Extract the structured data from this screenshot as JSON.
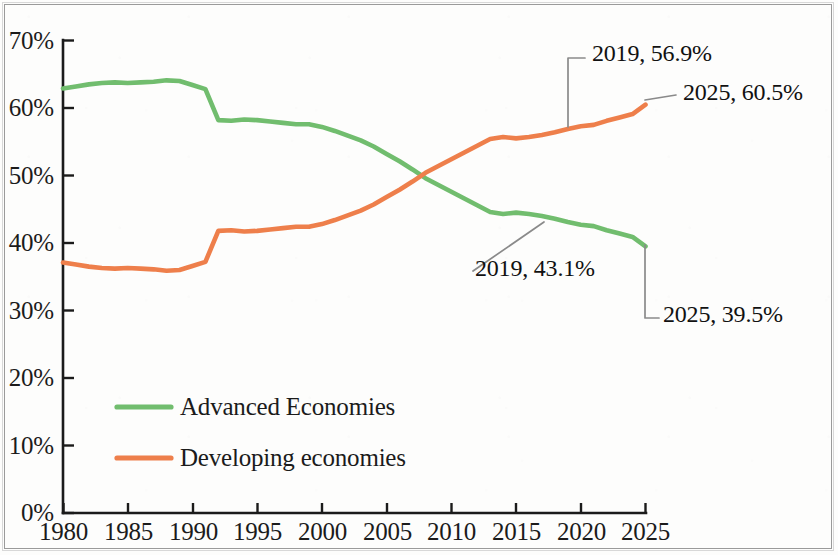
{
  "chart_data": {
    "type": "line",
    "title": "",
    "subtitle": "",
    "xlabel": "",
    "ylabel": "",
    "xlim": [
      1980,
      2025
    ],
    "ylim": [
      0,
      70
    ],
    "grid": false,
    "legend_position": "inside-lower-left",
    "x_ticks": [
      "1980",
      "1985",
      "1990",
      "1995",
      "2000",
      "2005",
      "2010",
      "2015",
      "2020",
      "2025"
    ],
    "y_ticks": [
      "0%",
      "10%",
      "20%",
      "30%",
      "40%",
      "50%",
      "60%",
      "70%"
    ],
    "x": [
      1980,
      1981,
      1982,
      1983,
      1984,
      1985,
      1986,
      1987,
      1988,
      1989,
      1990,
      1991,
      1992,
      1993,
      1994,
      1995,
      1996,
      1997,
      1998,
      1999,
      2000,
      2001,
      2002,
      2003,
      2004,
      2005,
      2006,
      2007,
      2008,
      2009,
      2010,
      2011,
      2012,
      2013,
      2014,
      2015,
      2016,
      2017,
      2018,
      2019,
      2020,
      2021,
      2022,
      2023,
      2024,
      2025
    ],
    "series": [
      {
        "name": "Advanced Economies",
        "color": "#71bd6e",
        "values": [
          62.9,
          63.2,
          63.5,
          63.7,
          63.8,
          63.7,
          63.8,
          63.9,
          64.1,
          64.0,
          63.4,
          62.8,
          58.2,
          58.1,
          58.3,
          58.2,
          58.0,
          57.8,
          57.6,
          57.6,
          57.2,
          56.6,
          55.9,
          55.2,
          54.3,
          53.2,
          52.1,
          50.9,
          49.6,
          48.6,
          47.6,
          46.6,
          45.6,
          44.6,
          44.3,
          44.5,
          44.3,
          44.0,
          43.6,
          43.1,
          42.7,
          42.5,
          41.9,
          41.4,
          40.9,
          39.5
        ]
      },
      {
        "name": "Developing economies",
        "color": "#ee7f4b",
        "values": [
          37.1,
          36.8,
          36.5,
          36.3,
          36.2,
          36.3,
          36.2,
          36.1,
          35.9,
          36.0,
          36.6,
          37.2,
          41.8,
          41.9,
          41.7,
          41.8,
          42.0,
          42.2,
          42.4,
          42.4,
          42.8,
          43.4,
          44.1,
          44.8,
          45.7,
          46.8,
          47.9,
          49.1,
          50.4,
          51.4,
          52.4,
          53.4,
          54.4,
          55.4,
          55.7,
          55.5,
          55.7,
          56.0,
          56.4,
          56.9,
          57.3,
          57.5,
          58.1,
          58.6,
          59.1,
          60.5
        ]
      }
    ],
    "annotations": [
      {
        "id": "dev-2019",
        "text": "2019, 56.9%",
        "x": 2019,
        "y": 56.9,
        "series": "Developing economies"
      },
      {
        "id": "dev-2025",
        "text": "2025, 60.5%",
        "x": 2025,
        "y": 60.5,
        "series": "Developing economies"
      },
      {
        "id": "adv-2019",
        "text": "2019, 43.1%",
        "x": 2019,
        "y": 43.1,
        "series": "Advanced Economies"
      },
      {
        "id": "adv-2025",
        "text": "2025, 39.5%",
        "x": 2025,
        "y": 39.5,
        "series": "Advanced Economies"
      }
    ],
    "legend": [
      {
        "label": "Advanced Economies",
        "color": "#71bd6e"
      },
      {
        "label": "Developing economies",
        "color": "#ee7f4b"
      }
    ],
    "colors": {
      "advanced": "#71bd6e",
      "developing": "#ee7f4b",
      "axis": "#1b1b1b",
      "annotation_leader": "#8a8a8a",
      "background": "#fdfdfc"
    }
  }
}
